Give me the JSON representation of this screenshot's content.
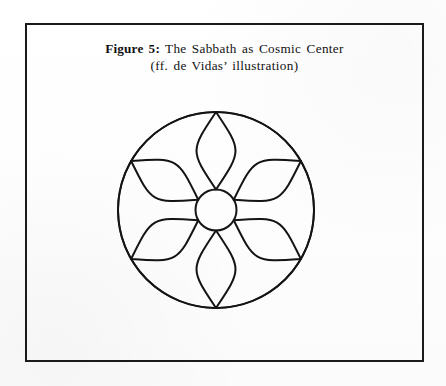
{
  "figure": {
    "caption_line_1_strong": "Figure 5:",
    "caption_line_1_rest": " The Sabbath as Cosmic Center",
    "caption_line_2": "(ff. de Vidas’ illustration)"
  },
  "diagram": {
    "name": "six-petal-rosette",
    "outer_circle": {
      "center_x": 216,
      "center_y": 210,
      "radius": 98
    },
    "hub_circle": {
      "center_x": 216,
      "center_y": 210,
      "radius": 20.5
    },
    "petal_count": 6,
    "petal_angles_deg": [
      90,
      150,
      210,
      270,
      330,
      30
    ],
    "petal_inner_radius": 20.5,
    "petal_outer_radius": 98,
    "petal_half_width": 26,
    "outer_arc_count": 6
  },
  "colors": {
    "ink": "#141414",
    "frame": "#1a1a1a",
    "paper": "#fefefe"
  }
}
